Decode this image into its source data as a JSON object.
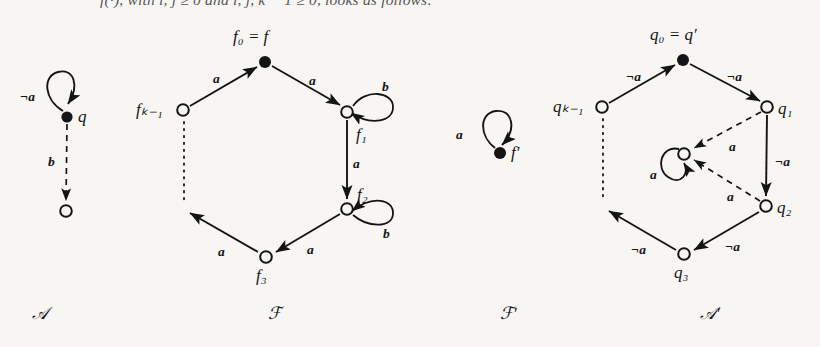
{
  "page": {
    "background": "#f7f6f3",
    "ink": "#141414",
    "cut_off_line": "f(·), with i, j ≥ 0 and i, j, k − 1 ≥ 0, looks as follows:"
  },
  "figure": {
    "caption_labels": [
      {
        "name": "automaton-a",
        "text": "𝒜",
        "x": 32,
        "y": 305
      },
      {
        "name": "automaton-f",
        "text": "ℱ",
        "x": 268,
        "y": 305
      },
      {
        "name": "automaton-f-prime",
        "text": "ℱ′",
        "x": 500,
        "y": 305
      },
      {
        "name": "automaton-a-prime",
        "text": "𝒜′",
        "x": 700,
        "y": 305
      }
    ],
    "automaton_a": {
      "name": "A",
      "nodes": [
        {
          "id": "q",
          "label": "q",
          "filled": true,
          "x": 67,
          "y": 117,
          "label_x": 78,
          "label_y": 108
        },
        {
          "id": "sink",
          "label": "",
          "filled": false,
          "x": 66,
          "y": 211
        }
      ],
      "edges": [
        {
          "from": "q",
          "to": "q",
          "label": "¬а",
          "label_text": "¬a",
          "style": "solid",
          "kind": "self-loop",
          "label_x": 20,
          "label_y": 90
        },
        {
          "from": "q",
          "to": "sink",
          "label_text": "b",
          "style": "dashed",
          "kind": "straight",
          "label_x": 48,
          "label_y": 155
        }
      ]
    },
    "automaton_f": {
      "name": "F",
      "nodes": [
        {
          "id": "f0",
          "label": "f₀ = f",
          "filled": true,
          "x": 265,
          "y": 62,
          "label_x": 233,
          "label_y": 28
        },
        {
          "id": "fk1",
          "label": "fₖ₋₁",
          "filled": false,
          "x": 183,
          "y": 110,
          "label_x": 136,
          "label_y": 101
        },
        {
          "id": "f1",
          "label": "f₁",
          "filled": false,
          "x": 347,
          "y": 112,
          "label_x": 356,
          "label_y": 126
        },
        {
          "id": "f2",
          "label": "f₂",
          "filled": false,
          "x": 347,
          "y": 209,
          "label_x": 357,
          "label_y": 186
        },
        {
          "id": "f3",
          "label": "f₃",
          "filled": false,
          "x": 266,
          "y": 257,
          "label_x": 256,
          "label_y": 267
        }
      ],
      "edges": [
        {
          "from": "fk1",
          "to": "f0",
          "label_text": "a",
          "style": "solid",
          "label_x": 213,
          "label_y": 72
        },
        {
          "from": "f0",
          "to": "f1",
          "label_text": "a",
          "style": "solid",
          "label_x": 309,
          "label_y": 74
        },
        {
          "from": "f1",
          "to": "f1",
          "label_text": "b",
          "style": "solid",
          "kind": "self-loop",
          "label_x": 382,
          "label_y": 80
        },
        {
          "from": "f1",
          "to": "f2",
          "label_text": "a",
          "style": "solid",
          "label_x": 353,
          "label_y": 157
        },
        {
          "from": "f2",
          "to": "f2",
          "label_text": "b",
          "style": "solid",
          "kind": "self-loop",
          "label_x": 383,
          "label_y": 227
        },
        {
          "from": "f2",
          "to": "f3",
          "label_text": "a",
          "style": "solid",
          "label_x": 307,
          "label_y": 243
        },
        {
          "from": "f3",
          "to": "fk1",
          "label_text": "a",
          "style": "solid",
          "label_x": 218,
          "label_y": 245
        }
      ],
      "dotted_gap": {
        "x": 184,
        "y1": 122,
        "y2": 202
      }
    },
    "automaton_f_prime": {
      "name": "F'",
      "nodes": [
        {
          "id": "fprime",
          "label": "f′",
          "filled": true,
          "x": 500,
          "y": 153,
          "label_x": 511,
          "label_y": 144
        }
      ],
      "edges": [
        {
          "from": "fprime",
          "to": "fprime",
          "label_text": "a",
          "style": "solid",
          "kind": "self-loop",
          "label_x": 456,
          "label_y": 128
        }
      ]
    },
    "automaton_a_prime": {
      "name": "A'",
      "nodes": [
        {
          "id": "q0",
          "label": "q₀ = q′",
          "filled": true,
          "x": 683,
          "y": 60,
          "label_x": 650,
          "label_y": 26
        },
        {
          "id": "qk1",
          "label": "qₖ₋₁",
          "filled": false,
          "x": 602,
          "y": 107,
          "label_x": 553,
          "label_y": 98
        },
        {
          "id": "q1",
          "label": "q₁",
          "filled": false,
          "x": 767,
          "y": 107,
          "label_x": 778,
          "label_y": 100
        },
        {
          "id": "q2",
          "label": "q₂",
          "filled": false,
          "x": 766,
          "y": 206,
          "label_x": 777,
          "label_y": 199
        },
        {
          "id": "q3",
          "label": "q₃",
          "filled": false,
          "x": 684,
          "y": 254,
          "label_x": 674,
          "label_y": 264
        },
        {
          "id": "qcenter",
          "label": "",
          "filled": false,
          "x": 684,
          "y": 154
        }
      ],
      "edges": [
        {
          "from": "qk1",
          "to": "q0",
          "label_text": "¬a",
          "style": "solid",
          "label_x": 626,
          "label_y": 70
        },
        {
          "from": "q0",
          "to": "q1",
          "label_text": "¬a",
          "style": "solid",
          "label_x": 727,
          "label_y": 70
        },
        {
          "from": "q1",
          "to": "q2",
          "label_text": "¬a",
          "style": "solid",
          "label_x": 775,
          "label_y": 155
        },
        {
          "from": "q2",
          "to": "q3",
          "label_text": "¬a",
          "style": "solid",
          "label_x": 725,
          "label_y": 240
        },
        {
          "from": "q3",
          "to": "qk1",
          "label_text": "¬a",
          "style": "solid",
          "label_x": 631,
          "label_y": 243
        },
        {
          "from": "q1",
          "to": "qcenter",
          "label_text": "a",
          "style": "dashed",
          "label_x": 729,
          "label_y": 140
        },
        {
          "from": "q2",
          "to": "qcenter",
          "label_text": "a",
          "style": "dashed",
          "label_x": 727,
          "label_y": 190
        },
        {
          "from": "qcenter",
          "to": "qcenter",
          "label_text": "a",
          "style": "solid",
          "kind": "self-loop",
          "label_x": 650,
          "label_y": 168
        }
      ],
      "dotted_gap": {
        "x": 603,
        "y1": 119,
        "y2": 199
      }
    }
  }
}
